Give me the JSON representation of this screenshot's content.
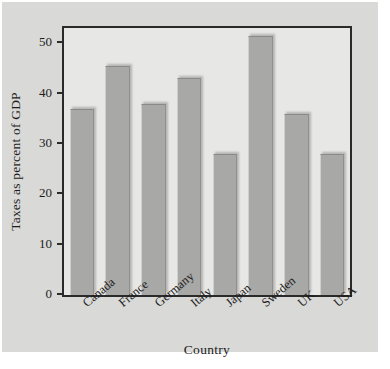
{
  "chart_data": {
    "type": "bar",
    "title": "",
    "subtitle": "",
    "xlabel": "Country",
    "ylabel": "Taxes as percent of GDP",
    "categories": [
      "Canada",
      "France",
      "Germany",
      "Italy",
      "Japan",
      "Sweden",
      "UK",
      "USA"
    ],
    "values": [
      37,
      45.5,
      38,
      43,
      28,
      51.5,
      36,
      28
    ],
    "series": [
      {
        "name": "Taxes as percent of GDP",
        "values": [
          37,
          45.5,
          38,
          43,
          28,
          51.5,
          36,
          28
        ]
      }
    ],
    "ylim": [
      0,
      53
    ],
    "yticks": [
      0,
      10,
      20,
      30,
      40,
      50
    ],
    "ytick_labels": [
      "0",
      "10",
      "20",
      "30",
      "40",
      "50"
    ],
    "grid": false,
    "legend": false,
    "legend_position": "none",
    "annotations": [],
    "bar_color": "#a8a8a6",
    "plot_background": "#e7e7e5",
    "figure_background": "#d9d9d7",
    "axis_color": "#2a2a2a"
  }
}
